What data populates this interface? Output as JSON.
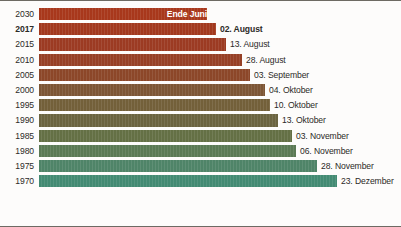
{
  "chart_data": {
    "type": "bar",
    "title": "",
    "subtitle": "",
    "xlabel": "",
    "ylabel": "",
    "orientation": "horizontal",
    "grid": false,
    "legend": null,
    "axis_note": "Bar length encodes the day of year on which the date falls; x-axis is unlabeled.",
    "categories": [
      "2030",
      "2017",
      "2015",
      "2010",
      "2005",
      "2000",
      "1995",
      "1990",
      "1985",
      "1980",
      "1975",
      "1970"
    ],
    "value_labels": [
      "Ende Juni",
      "02. August",
      "13. August",
      "28. August",
      "03. September",
      "04. Oktober",
      "10. Oktober",
      "13. Oktober",
      "03. November",
      "06. November",
      "28. November",
      "23. Dezember"
    ],
    "values": [
      181,
      214,
      225,
      240,
      246,
      277,
      283,
      286,
      307,
      310,
      332,
      357
    ],
    "xlim": [
      0,
      400
    ],
    "bars": [
      {
        "category": "2030",
        "label": "Ende Juni",
        "value": 181,
        "bar_end_px": 207,
        "color": "#a8381c",
        "label_inside": true,
        "emphasis": false
      },
      {
        "category": "2017",
        "label": "02. August",
        "value": 214,
        "bar_end_px": 216,
        "color": "#a2391e",
        "label_inside": false,
        "emphasis": true
      },
      {
        "category": "2015",
        "label": "13. August",
        "value": 225,
        "bar_end_px": 226,
        "color": "#9c3b23",
        "label_inside": false,
        "emphasis": false
      },
      {
        "category": "2010",
        "label": "28. August",
        "value": 240,
        "bar_end_px": 242,
        "color": "#964026",
        "label_inside": false,
        "emphasis": false
      },
      {
        "category": "2005",
        "label": "03. September",
        "value": 246,
        "bar_end_px": 250,
        "color": "#8c4729",
        "label_inside": false,
        "emphasis": false
      },
      {
        "category": "2000",
        "label": "04. Oktober",
        "value": 277,
        "bar_end_px": 265,
        "color": "#7d5635",
        "label_inside": false,
        "emphasis": false
      },
      {
        "category": "1995",
        "label": "10. Oktober",
        "value": 283,
        "bar_end_px": 270,
        "color": "#73603a",
        "label_inside": false,
        "emphasis": false
      },
      {
        "category": "1990",
        "label": "13. Oktober",
        "value": 286,
        "bar_end_px": 278,
        "color": "#6b6440",
        "label_inside": false,
        "emphasis": false
      },
      {
        "category": "1985",
        "label": "03. November",
        "value": 307,
        "bar_end_px": 292,
        "color": "#647045",
        "label_inside": false,
        "emphasis": false
      },
      {
        "category": "1980",
        "label": "06. November",
        "value": 310,
        "bar_end_px": 296,
        "color": "#5b7a55",
        "label_inside": false,
        "emphasis": false
      },
      {
        "category": "1975",
        "label": "28. November",
        "value": 332,
        "bar_end_px": 317,
        "color": "#4f8468",
        "label_inside": false,
        "emphasis": false
      },
      {
        "category": "1970",
        "label": "23. Dezember",
        "value": 357,
        "bar_end_px": 337,
        "color": "#438b73",
        "label_inside": false,
        "emphasis": false
      }
    ],
    "colors": {
      "background": "#fdfcfb",
      "text": "#2c2a27",
      "inside_label_text": "#ffffff",
      "border": "#6d6a63",
      "ramp_start": "#a8381c",
      "ramp_end": "#438b73"
    },
    "layout": {
      "plot_left_px": 39,
      "row_pitch_px": 15.2,
      "bar_height_px": 12.2,
      "first_row_top_px": 7
    }
  }
}
